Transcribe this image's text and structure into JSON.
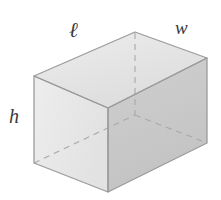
{
  "figure": {
    "name": "rectangular-prism-diagram",
    "shape": "rectangular prism",
    "caption": "",
    "labels": {
      "length": "ℓ",
      "width": "w",
      "height": "h"
    },
    "colors": {
      "background": "#ffffff",
      "top_face": "#e3e3e3",
      "front_face": "#e8e8e8",
      "right_face": "#c9c9c9",
      "edge_stroke": "#9a9a9a",
      "hidden_edge_stroke": "#aaaaaa",
      "label_text": "#3a3a3a"
    },
    "vertices": {
      "front_top_left": [
        34,
        76
      ],
      "front_top_right": [
        108,
        108
      ],
      "front_bottom_right": [
        108,
        192
      ],
      "front_bottom_left": [
        34,
        163
      ],
      "back_top_left": [
        135,
        32
      ],
      "back_top_right": [
        207,
        58
      ],
      "back_bottom_right": [
        207,
        143
      ],
      "back_bottom_hidden": [
        135,
        115
      ]
    },
    "edges_visible": [
      "front_top_left-front_top_right",
      "front_top_right-front_bottom_right",
      "front_bottom_right-front_bottom_left",
      "front_bottom_left-front_top_left",
      "front_top_left-back_top_left",
      "back_top_left-back_top_right",
      "back_top_right-front_top_right",
      "back_top_right-back_bottom_right",
      "back_bottom_right-front_bottom_right"
    ],
    "edges_hidden": [
      "back_top_left-back_bottom_hidden",
      "front_bottom_left-back_bottom_hidden",
      "back_bottom_hidden-back_bottom_right"
    ]
  }
}
